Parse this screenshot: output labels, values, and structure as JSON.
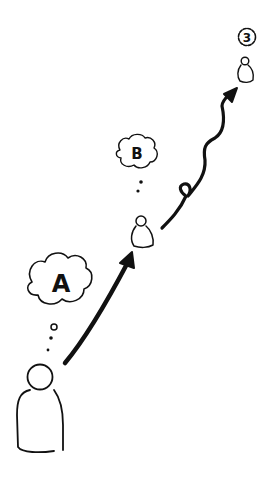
{
  "diagram": {
    "stages": [
      {
        "id": "A",
        "label": "A"
      },
      {
        "id": "B",
        "label": "B"
      },
      {
        "id": "3",
        "label": "3"
      }
    ],
    "colors": {
      "ink": "#111111",
      "background": "#ffffff"
    }
  }
}
